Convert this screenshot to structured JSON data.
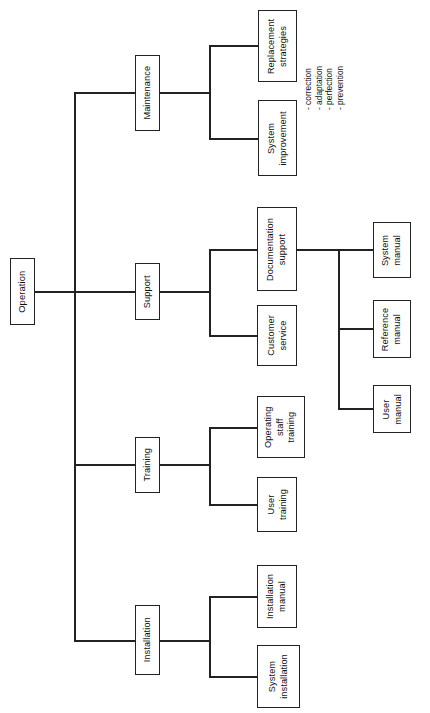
{
  "diagram": {
    "title": "Operation",
    "orientation": "rotated-90-ccw tree",
    "root": {
      "label": "Operation"
    },
    "level2": [
      {
        "label": "Maintenance"
      },
      {
        "label": "Support"
      },
      {
        "label": "Training"
      },
      {
        "label": "Installation"
      }
    ],
    "maintenance_children": [
      {
        "label": "Replacement\nstrategies",
        "line1": "Replacement",
        "line2": "strategies"
      },
      {
        "label": "System\nimprovement",
        "line1": "System",
        "line2": "improvement"
      }
    ],
    "support_children": [
      {
        "line1": "Documentation",
        "line2": "support"
      },
      {
        "line1": "Customer",
        "line2": "service"
      }
    ],
    "documentation_children": [
      {
        "line1": "System",
        "line2": "manual"
      },
      {
        "line1": "Reference",
        "line2": "manual"
      },
      {
        "line1": "User",
        "line2": "manual"
      }
    ],
    "training_children": [
      {
        "line1": "Operating",
        "line2": "staff",
        "line3": "training"
      },
      {
        "line1": "User",
        "line2": "training"
      }
    ],
    "installation_children": [
      {
        "line1": "Installation",
        "line2": "manual"
      },
      {
        "line1": "System",
        "line2": "installation"
      }
    ],
    "annotations": {
      "system_improvement_types": [
        "- correction",
        "- adaptation",
        "- perfection",
        "- prevention"
      ]
    },
    "caption_fragment": "",
    "colors": {
      "line": "#222222",
      "box_border": "#222222",
      "background": "#ffffff",
      "text": "#111111"
    }
  }
}
